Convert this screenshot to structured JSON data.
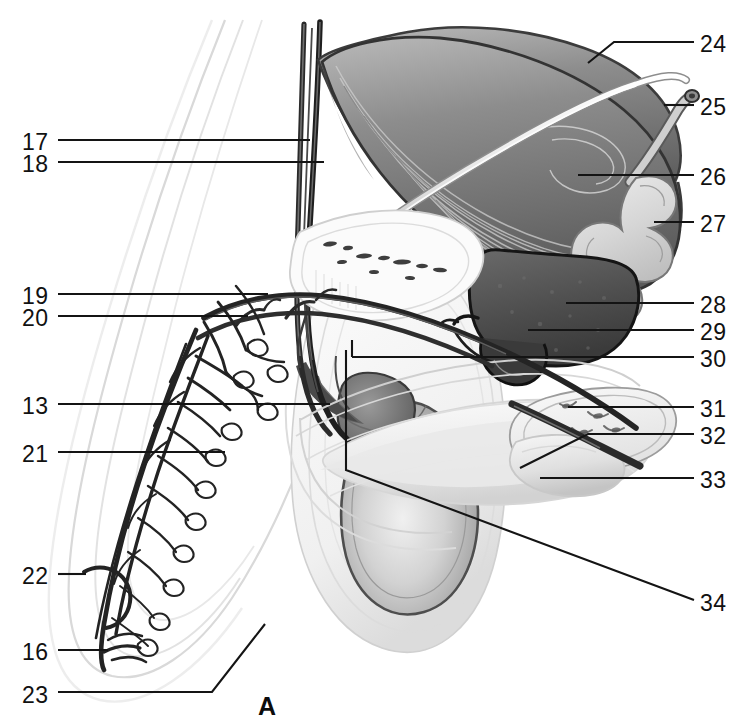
{
  "figure": {
    "panel_letter": "A",
    "background_color": "#ffffff",
    "ink_color": "#141414",
    "width": 749,
    "height": 727
  },
  "labels_left": [
    {
      "id": "17",
      "text": "17",
      "x": 22,
      "y": 131
    },
    {
      "id": "18",
      "text": "18",
      "x": 22,
      "y": 153
    },
    {
      "id": "19",
      "text": "19",
      "x": 22,
      "y": 285
    },
    {
      "id": "20",
      "text": "20",
      "x": 22,
      "y": 307
    },
    {
      "id": "13",
      "text": "13",
      "x": 22,
      "y": 395
    },
    {
      "id": "21",
      "text": "21",
      "x": 22,
      "y": 443
    },
    {
      "id": "22",
      "text": "22",
      "x": 22,
      "y": 565
    },
    {
      "id": "16",
      "text": "16",
      "x": 22,
      "y": 641
    },
    {
      "id": "23",
      "text": "23",
      "x": 22,
      "y": 684
    }
  ],
  "labels_right": [
    {
      "id": "24",
      "text": "24",
      "x": 700,
      "y": 33
    },
    {
      "id": "25",
      "text": "25",
      "x": 700,
      "y": 96
    },
    {
      "id": "26",
      "text": "26",
      "x": 700,
      "y": 166
    },
    {
      "id": "27",
      "text": "27",
      "x": 700,
      "y": 213
    },
    {
      "id": "28",
      "text": "28",
      "x": 700,
      "y": 294
    },
    {
      "id": "29",
      "text": "29",
      "x": 700,
      "y": 321
    },
    {
      "id": "30",
      "text": "30",
      "x": 700,
      "y": 348
    },
    {
      "id": "31",
      "text": "31",
      "x": 700,
      "y": 398
    },
    {
      "id": "32",
      "text": "32",
      "x": 700,
      "y": 425
    },
    {
      "id": "33",
      "text": "33",
      "x": 700,
      "y": 469
    },
    {
      "id": "34",
      "text": "34",
      "x": 700,
      "y": 592
    }
  ],
  "structures": [
    {
      "key": "bladder",
      "label_ref": "26",
      "tone": "#8a8a8a"
    },
    {
      "key": "ureter",
      "label_ref": "24",
      "tone": "#cfcfcf"
    },
    {
      "key": "ductus-deferens-cut",
      "label_ref": "25",
      "tone": "#b5b5b5"
    },
    {
      "key": "seminal-vesicle",
      "label_ref": "27",
      "tone": "#d8d8d8"
    },
    {
      "key": "prostate",
      "label_ref": "28",
      "tone": "#5c5c5c"
    },
    {
      "key": "prostatic-urethra",
      "label_ref": "29",
      "tone": "#3a3a3a"
    },
    {
      "key": "bulbourethral-gland",
      "label_ref": "30",
      "tone": "#2f2f2f"
    },
    {
      "key": "corpus-cavernosum",
      "label_ref": "31",
      "tone": "#e6e6e6"
    },
    {
      "key": "deep-artery-penis",
      "label_ref": "32",
      "tone": "#4a4a4a"
    },
    {
      "key": "glans-penis",
      "label_ref": "33",
      "tone": "#dedede"
    },
    {
      "key": "corpus-spongiosum",
      "label_ref": "34",
      "tone": "#ededed"
    },
    {
      "key": "spermatic-vessels",
      "label_ref": "17",
      "tone": "#2a2a2a"
    },
    {
      "key": "pampiniform-plexus",
      "label_ref": "18",
      "tone": "#343434"
    },
    {
      "key": "dorsal-penile-artery",
      "label_ref": "19",
      "tone": "#262626"
    },
    {
      "key": "dorsal-penile-vein",
      "label_ref": "20",
      "tone": "#303030"
    },
    {
      "key": "epididymis-head",
      "label_ref": "13",
      "tone": "#6d6d6d"
    },
    {
      "key": "scrotal-branches",
      "label_ref": "21",
      "tone": "#2b2b2b"
    },
    {
      "key": "scrotal-artery",
      "label_ref": "22",
      "tone": "#242424"
    },
    {
      "key": "scrotal-septum",
      "label_ref": "16",
      "tone": "#222222"
    },
    {
      "key": "testis",
      "label_ref": "23",
      "tone": "#bdbdbd"
    }
  ]
}
